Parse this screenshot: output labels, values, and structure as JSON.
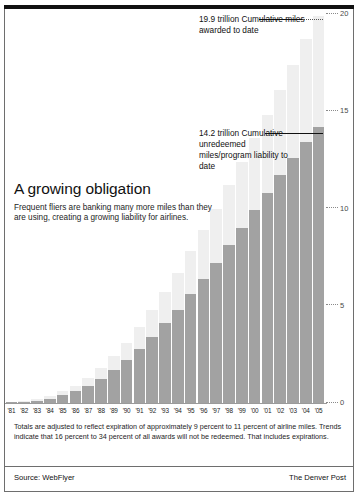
{
  "headline": "A growing obligation",
  "subhead": "Frequent fliers are banking many more miles than they are using, creating a growing liability for airlines.",
  "callouts": {
    "top": "19.9 trillion Cumulative miles awarded to date",
    "middle": "14.2 trillion Cumulative unredeemed miles/program liability to date"
  },
  "footnote": "Totals are adjusted to reflect expiration of approximately 9 percent to 11 percent of airline miles. Trends indicate that 16 percent to 34 percent of all awards will not be redeemed. That includes expirations.",
  "footer": {
    "source": "Source: WebFlyer",
    "credit": "The Denver Post"
  },
  "colors": {
    "awarded_bar": "#efefef",
    "unredeemed_bar": "#a2a2a2",
    "rule": "#111111",
    "axis_text": "#4a4a4a"
  },
  "chart_data": {
    "type": "bar",
    "title": "A growing obligation",
    "xlabel": "",
    "ylabel": "",
    "ylim": [
      0,
      20
    ],
    "yticks": [
      0,
      5,
      10,
      15,
      20
    ],
    "ytick_labels": [
      "0",
      "5",
      "10",
      "15",
      "20"
    ],
    "grid": false,
    "legend_position": "none",
    "categories": [
      "'81",
      "'82",
      "'83",
      "'84",
      "'85",
      "'86",
      "'87",
      "'88",
      "'89",
      "'90",
      "'91",
      "'92",
      "'93",
      "'94",
      "'95",
      "'96",
      "'97",
      "'98",
      "'99",
      "'00",
      "'01",
      "'02",
      "'03",
      "'04",
      "'05"
    ],
    "series": [
      {
        "name": "Cumulative miles awarded to date",
        "color": "#efefef",
        "values": [
          0.05,
          0.1,
          0.2,
          0.35,
          0.6,
          0.9,
          1.3,
          1.8,
          2.4,
          3.1,
          3.9,
          4.8,
          5.7,
          6.7,
          7.8,
          8.9,
          10.0,
          11.2,
          12.4,
          13.6,
          14.8,
          16.1,
          17.4,
          18.7,
          19.9
        ],
        "final_value": 19.9,
        "final_label": "19.9 trillion"
      },
      {
        "name": "Cumulative unredeemed miles/program liability to date",
        "color": "#a2a2a2",
        "values": [
          0.03,
          0.06,
          0.12,
          0.22,
          0.4,
          0.62,
          0.9,
          1.25,
          1.7,
          2.2,
          2.8,
          3.4,
          4.1,
          4.8,
          5.6,
          6.4,
          7.2,
          8.1,
          9.0,
          9.9,
          10.8,
          11.7,
          12.6,
          13.4,
          14.2
        ],
        "final_value": 14.2,
        "final_label": "14.2 trillion"
      }
    ],
    "annotations": [
      {
        "text": "19.9 trillion Cumulative miles awarded to date",
        "value": 19.9,
        "category": "'05"
      },
      {
        "text": "14.2 trillion Cumulative unredeemed miles/program liability to date",
        "value": 14.2,
        "category": "'05"
      }
    ]
  }
}
